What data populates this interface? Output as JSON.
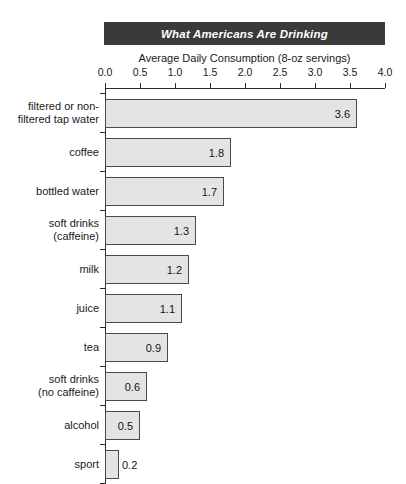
{
  "chart_data": {
    "type": "bar",
    "orientation": "horizontal",
    "title": "What Americans Are Drinking",
    "subtitle": "Average Daily Consumption (8-oz servings)",
    "xlabel": "",
    "ylabel": "",
    "xlim": [
      0.0,
      4.0
    ],
    "xticks": [
      "0.0",
      "0.5",
      "1.0",
      "1.5",
      "2.0",
      "2.5",
      "3.0",
      "3.5",
      "4.0"
    ],
    "xtick_values": [
      0.0,
      0.5,
      1.0,
      1.5,
      2.0,
      2.5,
      3.0,
      3.5,
      4.0
    ],
    "grid": false,
    "legend": null,
    "categories": [
      "filtered or non-filtered tap water",
      "coffee",
      "bottled water",
      "soft drinks (caffeine)",
      "milk",
      "juice",
      "tea",
      "soft drinks (no caffeine)",
      "alcohol",
      "sport"
    ],
    "values": [
      3.6,
      1.8,
      1.7,
      1.3,
      1.2,
      1.1,
      0.9,
      0.6,
      0.5,
      0.2
    ],
    "value_labels": [
      "3.6",
      "1.8",
      "1.7",
      "1.3",
      "1.2",
      "1.1",
      "0.9",
      "0.6",
      "0.5",
      "0.2"
    ],
    "label_placement": [
      "inside",
      "inside",
      "inside",
      "inside",
      "inside",
      "inside",
      "inside",
      "inside",
      "inside",
      "outside"
    ],
    "bars": [
      {
        "label_line1": "filtered or non-",
        "label_line2": "filtered tap water",
        "value": 3.6,
        "value_label": "3.6",
        "placement": "inside"
      },
      {
        "label_line1": "coffee",
        "label_line2": "",
        "value": 1.8,
        "value_label": "1.8",
        "placement": "inside"
      },
      {
        "label_line1": "bottled water",
        "label_line2": "",
        "value": 1.7,
        "value_label": "1.7",
        "placement": "inside"
      },
      {
        "label_line1": "soft drinks",
        "label_line2": "(caffeine)",
        "value": 1.3,
        "value_label": "1.3",
        "placement": "inside"
      },
      {
        "label_line1": "milk",
        "label_line2": "",
        "value": 1.2,
        "value_label": "1.2",
        "placement": "inside"
      },
      {
        "label_line1": "juice",
        "label_line2": "",
        "value": 1.1,
        "value_label": "1.1",
        "placement": "inside"
      },
      {
        "label_line1": "tea",
        "label_line2": "",
        "value": 0.9,
        "value_label": "0.9",
        "placement": "inside"
      },
      {
        "label_line1": "soft drinks",
        "label_line2": "(no caffeine)",
        "value": 0.6,
        "value_label": "0.6",
        "placement": "inside"
      },
      {
        "label_line1": "alcohol",
        "label_line2": "",
        "value": 0.5,
        "value_label": "0.5",
        "placement": "inside"
      },
      {
        "label_line1": "sport",
        "label_line2": "",
        "value": 0.2,
        "value_label": "0.2",
        "placement": "outside"
      }
    ],
    "colors": {
      "bar_fill": "#e4e4e4",
      "bar_edge": "#4a4a4a",
      "title_banner_bg": "#3a3a3a",
      "title_text": "#ffffff",
      "axis": "#2b2b2b",
      "text": "#1a1a1a",
      "background": "#ffffff"
    }
  }
}
